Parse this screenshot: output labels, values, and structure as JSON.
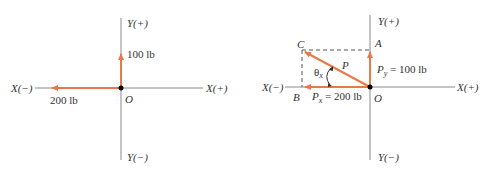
{
  "colors": {
    "axis": "#8a8a8a",
    "vector": "#e8794a",
    "text": "#333333",
    "dashed": "#555555",
    "origin": "#000000"
  },
  "left_diagram": {
    "axis_labels": {
      "y_pos": "Y(+)",
      "y_neg": "Y(−)",
      "x_pos": "X(+)",
      "x_neg": "X(−)"
    },
    "origin_label": "O",
    "vectors": [
      {
        "name": "vertical-force",
        "label": "100 lb",
        "direction": "up"
      },
      {
        "name": "horizontal-force",
        "label": "200 lb",
        "direction": "left"
      }
    ]
  },
  "right_diagram": {
    "axis_labels": {
      "y_pos": "Y(+)",
      "y_neg": "Y(−)",
      "x_pos": "X(+)",
      "x_neg": "X(−)"
    },
    "origin_label": "O",
    "points": {
      "A": "A",
      "B": "B",
      "C": "C"
    },
    "resultant_label": "P",
    "angle_label": "θ",
    "angle_sub": "x",
    "px": {
      "symbol": "P",
      "sub": "x",
      "value": " = 200 lb"
    },
    "py": {
      "symbol": "P",
      "sub": "y",
      "value": " = 100 lb"
    }
  }
}
